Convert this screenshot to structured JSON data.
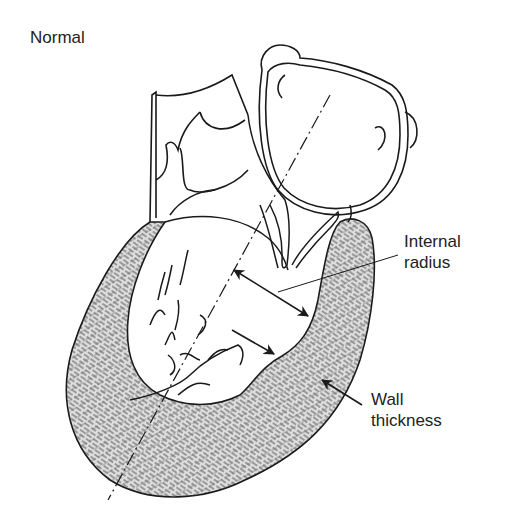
{
  "diagram": {
    "title": "Normal",
    "labels": [
      {
        "id": "internal-radius",
        "lines": [
          "Internal",
          "radius"
        ]
      },
      {
        "id": "wall-thickness",
        "lines": [
          "Wall",
          "thickness"
        ]
      }
    ],
    "colors": {
      "stroke": "#1a1a1a",
      "wall_fill": "#dcdcdc",
      "hatch": "#555555",
      "background": "#ffffff",
      "text": "#222222"
    }
  }
}
